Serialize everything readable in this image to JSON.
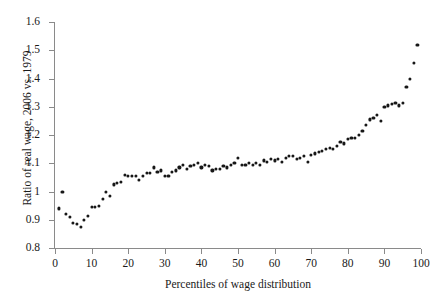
{
  "chart_data": {
    "type": "scatter",
    "title": "",
    "xlabel": "Percentiles of wage distribution",
    "ylabel": "Ratio of real wage, 2006 vs. 1979",
    "xlim": [
      0,
      100
    ],
    "ylim": [
      0.8,
      1.6
    ],
    "xticks": [
      0,
      10,
      20,
      30,
      40,
      50,
      60,
      70,
      80,
      90,
      100
    ],
    "yticks": [
      0.8,
      0.9,
      1,
      1.1,
      1.2,
      1.3,
      1.4,
      1.5,
      1.6
    ],
    "ytick_labels": [
      "0.8",
      "0.9",
      "1",
      "1.1",
      "1.2",
      "1.3",
      "1.4",
      "1.5",
      "1.6"
    ],
    "xtick_labels": [
      "0",
      "10",
      "20",
      "30",
      "40",
      "50",
      "60",
      "70",
      "80",
      "90",
      "100"
    ],
    "grid": false,
    "legend": null,
    "marker": "filled-circle",
    "marker_color": "#171717",
    "axis_color": "#8a8a8a",
    "series": [
      {
        "name": "Ratio of real wage 2006 vs 1979",
        "x": [
          1,
          2,
          3,
          4,
          5,
          6,
          7,
          8,
          9,
          10,
          11,
          12,
          13,
          14,
          15,
          16,
          17,
          18,
          19,
          20,
          21,
          22,
          23,
          24,
          25,
          26,
          27,
          28,
          29,
          30,
          31,
          32,
          33,
          34,
          35,
          36,
          37,
          38,
          39,
          40,
          41,
          42,
          43,
          44,
          45,
          46,
          47,
          48,
          49,
          50,
          51,
          52,
          53,
          54,
          55,
          56,
          57,
          58,
          59,
          60,
          61,
          62,
          63,
          64,
          65,
          66,
          67,
          68,
          69,
          70,
          71,
          72,
          73,
          74,
          75,
          76,
          77,
          78,
          79,
          80,
          81,
          82,
          83,
          84,
          85,
          86,
          87,
          88,
          89,
          90,
          91,
          92,
          93,
          94,
          95,
          96,
          97,
          98,
          99
        ],
        "y": [
          0.94,
          1.0,
          0.92,
          0.91,
          0.89,
          0.885,
          0.875,
          0.9,
          0.915,
          0.945,
          0.945,
          0.95,
          0.975,
          1.0,
          0.985,
          1.025,
          1.03,
          1.035,
          1.06,
          1.055,
          1.055,
          1.055,
          1.04,
          1.055,
          1.065,
          1.065,
          1.085,
          1.07,
          1.075,
          1.055,
          1.055,
          1.07,
          1.075,
          1.085,
          1.095,
          1.08,
          1.09,
          1.095,
          1.1,
          1.085,
          1.095,
          1.09,
          1.075,
          1.08,
          1.08,
          1.09,
          1.085,
          1.095,
          1.1,
          1.12,
          1.095,
          1.095,
          1.1,
          1.095,
          1.1,
          1.095,
          1.11,
          1.105,
          1.115,
          1.11,
          1.115,
          1.105,
          1.12,
          1.125,
          1.125,
          1.115,
          1.12,
          1.125,
          1.105,
          1.13,
          1.135,
          1.14,
          1.145,
          1.15,
          1.155,
          1.15,
          1.16,
          1.175,
          1.17,
          1.185,
          1.19,
          1.19,
          1.2,
          1.215,
          1.235,
          1.255,
          1.26,
          1.27,
          1.25,
          1.3,
          1.305,
          1.31,
          1.315,
          1.305,
          1.315,
          1.37,
          1.4,
          1.455,
          1.52
        ]
      }
    ]
  }
}
